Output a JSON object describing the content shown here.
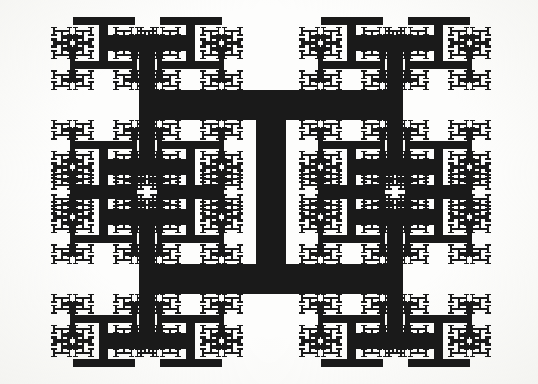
{
  "figure": {
    "kind": "h-tree-fractal",
    "caption": ""
  },
  "canvas": {
    "width": 538,
    "height": 384,
    "background_color": "#fdfdfc"
  },
  "chart_data": {
    "type": "diagram",
    "subtitle": "",
    "xlabel": "",
    "ylabel": "",
    "legend": [],
    "annotations": [],
    "grid": false,
    "geometry": {
      "shape": "H-tree",
      "description": "Each H is a vertical trunk with two horizontal arms (top and bottom); four copies scaled by 1/2 are attached at the four arm endpoints.",
      "bounding_box": {
        "x": 22,
        "y": 18,
        "width": 498,
        "height": 348
      },
      "root_center": {
        "x": 271,
        "y": 192
      },
      "root_arm_half_width": 124,
      "root_arm_half_height": 87,
      "recursion_depth": 6,
      "scale_factor": 0.5,
      "root_stroke_width": 30,
      "stroke_scale_factor": 0.52,
      "min_stroke_width": 1.6,
      "stroke_color": "#1a1a1a",
      "fill_color": "#fdfdfc",
      "line_cap": "butt",
      "line_join": "miter"
    },
    "levels": [
      {
        "level": 0,
        "count": 1,
        "half_width": 124.0,
        "half_height": 87.0,
        "stroke_width": 30.0
      },
      {
        "level": 1,
        "count": 4,
        "half_width": 62.0,
        "half_height": 43.5,
        "stroke_width": 15.6
      },
      {
        "level": 2,
        "count": 16,
        "half_width": 31.0,
        "half_height": 21.8,
        "stroke_width": 8.11
      },
      {
        "level": 3,
        "count": 64,
        "half_width": 15.5,
        "half_height": 10.9,
        "stroke_width": 4.22
      },
      {
        "level": 4,
        "count": 256,
        "half_width": 7.8,
        "half_height": 5.4,
        "stroke_width": 2.19
      },
      {
        "level": 5,
        "count": 1024,
        "half_width": 3.9,
        "half_height": 2.7,
        "stroke_width": 1.6
      }
    ]
  }
}
